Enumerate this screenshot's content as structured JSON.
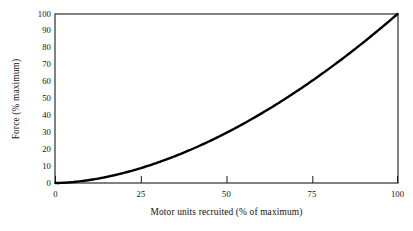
{
  "chart_data": {
    "type": "line",
    "title": "",
    "xlabel": "Motor units recruited (% of maximum)",
    "ylabel": "Force (% maximum)",
    "xlim": [
      0,
      100
    ],
    "ylim": [
      0,
      100
    ],
    "xticks": [
      "0",
      "25",
      "50",
      "75",
      "100"
    ],
    "xtick_values": [
      0,
      25,
      50,
      75,
      100
    ],
    "yticks": [
      "0",
      "10",
      "20",
      "30",
      "40",
      "50",
      "60",
      "70",
      "80",
      "90",
      "100"
    ],
    "ytick_values": [
      0,
      10,
      20,
      30,
      40,
      50,
      60,
      70,
      80,
      90,
      100
    ],
    "grid": false,
    "legend": "none",
    "series": [
      {
        "name": "Force vs motor units recruited",
        "color": "#000000",
        "line_width": 2.4,
        "x": [
          0,
          5,
          10,
          15,
          20,
          25,
          30,
          35,
          40,
          45,
          50,
          55,
          60,
          65,
          70,
          75,
          80,
          85,
          90,
          95,
          100
        ],
        "y": [
          0,
          0.6,
          2.0,
          4.1,
          6.9,
          10.3,
          14.2,
          18.7,
          23.6,
          29.0,
          34.8,
          41.0,
          47.6,
          54.6,
          62.0,
          69.7,
          77.8,
          86.2,
          95.0,
          104.1,
          100
        ]
      }
    ],
    "curve_description": "Smooth upward-curving (accelerating, roughly power-law y = 100*(x/100)^1.75) black line from origin (0,0) to (100,100)",
    "axis_frame": "full rectangular box border",
    "background_color": "#ffffff"
  },
  "figure": {
    "name": "force-vs-motor-units-recruitment-curve",
    "caption": ""
  }
}
